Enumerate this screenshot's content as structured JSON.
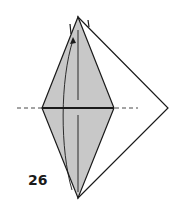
{
  "diagram": {
    "type": "origami-fold-step",
    "step_number": "26",
    "colors": {
      "paper_fill": "#c8c8c8",
      "line": "#1a1a1a",
      "background": "#ffffff"
    }
  }
}
